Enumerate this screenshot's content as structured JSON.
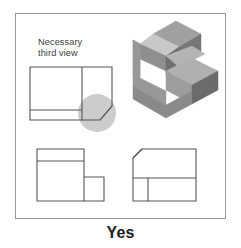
{
  "caption": {
    "text": "Yes"
  },
  "panel": {
    "border_color": "#9a9a9a",
    "background": "#ffffff"
  },
  "annotation": {
    "line1": "Necessary",
    "line2": "third view",
    "color": "#3c3c3c"
  },
  "highlight": {
    "name": "callout-circle",
    "cx": 97,
    "cy": 113,
    "r": 19,
    "fill": "#b8b8b8",
    "opacity": 0.72
  },
  "line_style": {
    "stroke": "#555555",
    "width": 1.1
  },
  "views": {
    "top_left": {
      "title": "top-view-with-chamfer",
      "outline": "M30,67 L112,67 L112,106 L100,120 L30,120 Z",
      "inner_lines": [
        "M82,67 L82,120",
        "M30,110 L82,110"
      ],
      "chamfer": "M112,106 L100,120"
    },
    "bottom_left": {
      "title": "front-view-L-shape",
      "outline": "M37,149 L84,149 L84,177 L104,177 L104,201 L37,201 Z",
      "inner_lines": [
        "M37,161 L84,161",
        "M84,177 L84,201"
      ]
    },
    "bottom_right": {
      "title": "side-view-with-chamfer",
      "outline": "M142,149 L196,149 L196,201 L133,201 L133,158 Z",
      "inner_lines": [
        "M133,178 L196,178",
        "M148,178 L148,201"
      ],
      "chamfer": "M133,158 L142,149"
    }
  },
  "solid": {
    "title": "isometric-solid-object",
    "faces": [
      {
        "name": "top-rear-face",
        "points": "176,21 201,34 179,47 153,34",
        "fill": "#a0a0a0"
      },
      {
        "name": "top-bevel-face",
        "points": "153,34 179,47 166,56 140,44",
        "fill": "#c8c8c8"
      },
      {
        "name": "top-front-slope",
        "points": "140,44 166,56 166,71 140,59",
        "fill": "#8f8f8f"
      },
      {
        "name": "upper-left-face",
        "points": "140,44 140,59 140,78 133,74 133,40",
        "fill": "#9b9b9b"
      },
      {
        "name": "left-main-face",
        "points": "133,40 140,44 140,78 166,91 166,105 133,86",
        "fill": "#989898"
      },
      {
        "name": "mid-ledge-face",
        "points": "179,47 201,34 201,54 179,67",
        "fill": "#777777"
      },
      {
        "name": "right-upper-face",
        "points": "166,56 179,47 179,67 166,76",
        "fill": "#6f6f6f"
      },
      {
        "name": "step-top-face",
        "points": "166,56 179,67 205,54 192,46",
        "fill": "#b4b4b4"
      },
      {
        "name": "lower-top-face",
        "points": "166,71 192,58 218,71 192,85",
        "fill": "#b0b0b0"
      },
      {
        "name": "lower-front-face",
        "points": "166,71 192,85 192,104 166,90",
        "fill": "#9d9d9d"
      },
      {
        "name": "lower-right-face",
        "points": "192,85 218,71 218,90 192,104",
        "fill": "#6b6b6b"
      },
      {
        "name": "bottom-front-face",
        "points": "133,86 166,105 192,91 192,104 166,118 133,99",
        "fill": "#8a8a8a"
      }
    ]
  }
}
